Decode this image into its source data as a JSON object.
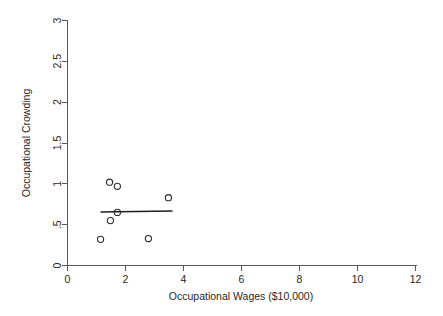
{
  "chart_data": {
    "type": "scatter",
    "title": "",
    "xlabel": "Occupational Wages ($10,000)",
    "ylabel": "Occupational Crowding",
    "xlim": [
      0,
      12
    ],
    "ylim": [
      0,
      3
    ],
    "xticks": [
      0,
      2,
      4,
      6,
      8,
      10,
      12
    ],
    "xtick_labels": [
      "0",
      "2",
      "4",
      "6",
      "8",
      "10",
      "12"
    ],
    "yticks": [
      0,
      0.5,
      1,
      1.5,
      2,
      2.5,
      3
    ],
    "ytick_labels": [
      "0",
      ".5",
      "1",
      "1.5",
      "2",
      "2.5",
      "3"
    ],
    "grid": false,
    "legend": null,
    "marker": "open-circle",
    "marker_color": "#2b2b2b",
    "points": [
      {
        "x": 1.14,
        "y": 0.32
      },
      {
        "x": 1.45,
        "y": 1.02
      },
      {
        "x": 1.48,
        "y": 0.55
      },
      {
        "x": 1.72,
        "y": 0.97
      },
      {
        "x": 1.72,
        "y": 0.65
      },
      {
        "x": 2.79,
        "y": 0.33
      },
      {
        "x": 3.48,
        "y": 0.83
      }
    ],
    "fit_line": {
      "label": "linear fit",
      "color": "#1d1d1d",
      "x_start": 1.14,
      "y_start": 0.655,
      "x_end": 3.62,
      "y_end": 0.668
    }
  },
  "axes": {
    "x_title": "Occupational Wages ($10,000)",
    "y_title": "Occupational Crowding"
  }
}
